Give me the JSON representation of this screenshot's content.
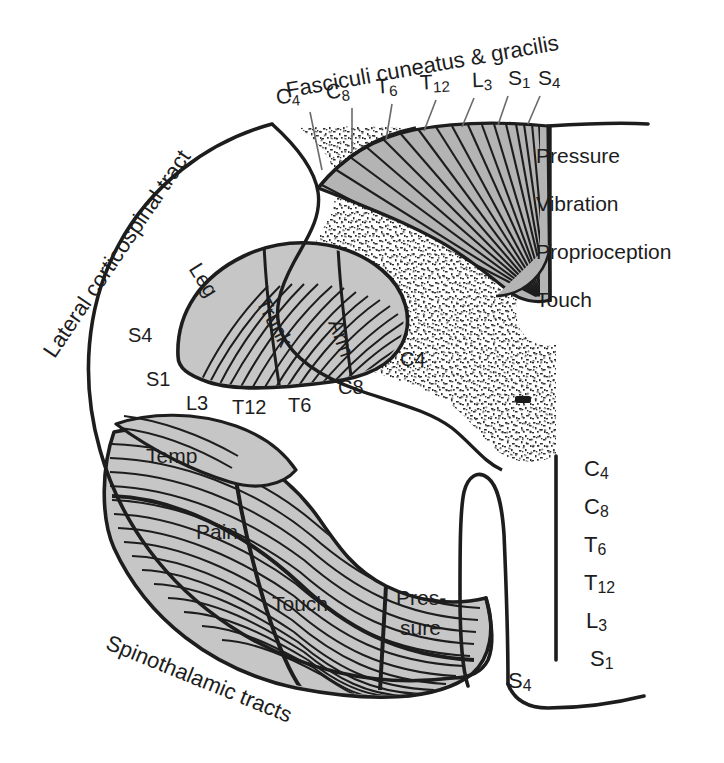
{
  "figure": {
    "colors": {
      "ink": "#1d1d1d",
      "tract_gray": "#c6c6c6",
      "dorsal_column_gray": "#b4b4b4",
      "gray_matter_stipple": "#3a3a3a",
      "background": "#ffffff"
    }
  },
  "labels": {
    "dorsal_column_title": "Fasciculi cuneatus & gracilis",
    "lateral_corticospinal_title": "Lateral corticospinal tract",
    "spinothalamic_title": "Spinothalamic tracts"
  },
  "dorsal_column_segments": [
    {
      "root": "C",
      "num": "4"
    },
    {
      "root": "C",
      "num": "8"
    },
    {
      "root": "T",
      "num": "6"
    },
    {
      "root": "T",
      "num": "12"
    },
    {
      "root": "L",
      "num": "3"
    },
    {
      "root": "S",
      "num": "1"
    },
    {
      "root": "S",
      "num": "4"
    }
  ],
  "dorsal_column_modalities": [
    "Pressure",
    "Vibration",
    "Proprioception",
    "Touch"
  ],
  "corticospinal_body_parts": [
    "Leg",
    "Trunk",
    "Arm"
  ],
  "corticospinal_segments": [
    {
      "text": "S4"
    },
    {
      "text": "S1"
    },
    {
      "text": "L3"
    },
    {
      "text": "T12"
    },
    {
      "text": "T6"
    },
    {
      "text": "C8"
    },
    {
      "text": "C4"
    }
  ],
  "spinothalamic_modalities": [
    "Temp",
    "Pain",
    "Touch",
    "Pres-",
    "sure"
  ],
  "spinothalamic_segments": [
    {
      "root": "C",
      "num": "4"
    },
    {
      "root": "C",
      "num": "8"
    },
    {
      "root": "T",
      "num": "6"
    },
    {
      "root": "T",
      "num": "12"
    },
    {
      "root": "L",
      "num": "3"
    },
    {
      "root": "S",
      "num": "1"
    },
    {
      "root": "S",
      "num": "4"
    }
  ]
}
